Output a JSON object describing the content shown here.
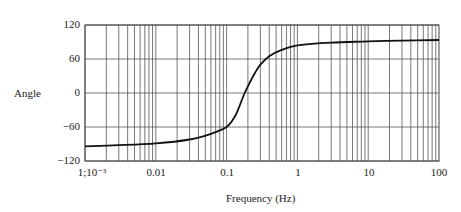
{
  "chart_data": {
    "type": "line",
    "title": "",
    "xlabel": "Frequency (Hz)",
    "ylabel": "Angle",
    "xscale": "log",
    "xlim": [
      0.001,
      100
    ],
    "ylim": [
      -120,
      120
    ],
    "grid": true,
    "x_tick_labels": [
      "1;10⁻³",
      "0.01",
      "0.1",
      "1",
      "10",
      "100"
    ],
    "y_tick_labels": [
      "120",
      "60",
      "0",
      "−60",
      "−120"
    ],
    "series": [
      {
        "name": "phase",
        "x": [
          0.001,
          0.003,
          0.01,
          0.03,
          0.06,
          0.1,
          0.13,
          0.15,
          0.18,
          0.22,
          0.25,
          0.3,
          0.4,
          0.6,
          1,
          3,
          10,
          30,
          100
        ],
        "y": [
          -94,
          -92,
          -89,
          -82,
          -72,
          -60,
          -42,
          -25,
          0,
          22,
          35,
          50,
          65,
          76,
          84,
          89,
          91,
          92.5,
          93.5
        ]
      }
    ]
  },
  "labels": {
    "ylabel": "Angle",
    "xlabel": "Frequency (Hz)",
    "yticks": [
      "120",
      "60",
      "0",
      "−60",
      "−120"
    ],
    "xticks": [
      "1;10⁻³",
      "0.01",
      "0.1",
      "1",
      "10",
      "100"
    ]
  }
}
